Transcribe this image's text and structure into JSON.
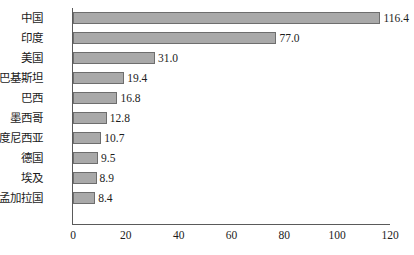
{
  "chart_data": {
    "type": "bar",
    "orientation": "horizontal",
    "title": "",
    "subtitle": "",
    "xlabel": "",
    "ylabel": "",
    "grid": false,
    "legend": null,
    "xlim": [
      0,
      120
    ],
    "xticks": [
      0,
      20,
      40,
      60,
      80,
      100,
      120
    ],
    "xtick_labels": [
      "0",
      "20",
      "40",
      "60",
      "80",
      "100",
      "120"
    ],
    "categories": [
      "中国",
      "印度",
      "美国",
      "巴基斯坦",
      "巴西",
      "墨西哥",
      "印度尼西亚",
      "德国",
      "埃及",
      "孟加拉国"
    ],
    "values": [
      116.4,
      77.0,
      31.0,
      19.4,
      16.8,
      12.8,
      10.7,
      9.5,
      8.9,
      8.4
    ],
    "value_labels": [
      "116.4",
      "77.0",
      "31.0",
      "19.4",
      "16.8",
      "12.8",
      "10.7",
      "9.5",
      "8.9",
      "8.4"
    ],
    "colors": {
      "bar_fill": "#a9a9a9",
      "bar_border": "#6e6e6e",
      "axis": "#5a5a5a",
      "text": "#1c1c1c",
      "background": "#ffffff"
    }
  }
}
